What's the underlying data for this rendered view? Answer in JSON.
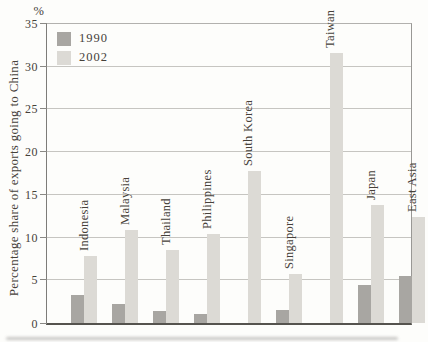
{
  "figure": {
    "percent_symbol": "%",
    "y_axis_title": "Percentage share of exports going to China"
  },
  "chart_data": {
    "type": "bar",
    "title": "",
    "xlabel": "",
    "ylabel": "Percentage share of exports going to China",
    "y_unit_label": "%",
    "ylim": [
      0,
      35
    ],
    "yticks": [
      0,
      5,
      10,
      15,
      20,
      25,
      30,
      35
    ],
    "grid": true,
    "legend_position": "top-left",
    "categories": [
      "Indonesia",
      "Malaysia",
      "Thailand",
      "Philippines",
      "South Korea",
      "Singapore",
      "Taiwan",
      "Japan",
      "East Asia"
    ],
    "series": [
      {
        "name": "1990",
        "color": "#a8a6a2",
        "values": [
          3.3,
          2.2,
          1.4,
          1.0,
          0,
          1.5,
          0,
          4.4,
          5.5
        ]
      },
      {
        "name": "2002",
        "color": "#dcdad5",
        "values": [
          7.8,
          10.9,
          8.5,
          10.4,
          17.8,
          5.7,
          31.6,
          13.8,
          12.4
        ]
      }
    ]
  },
  "colors": {
    "background": "#fdfdfb",
    "text": "#46413a",
    "gridline": "#c6c5c1",
    "axis_bottom": "#55534e",
    "bar_1990": "#a8a6a2",
    "bar_2002": "#dcdad5"
  }
}
